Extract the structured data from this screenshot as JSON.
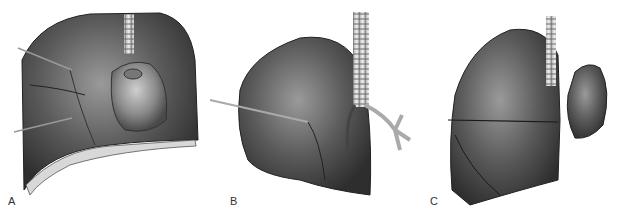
{
  "figure": {
    "panels": [
      {
        "label": "A",
        "description": "Opened thorax showing lungs and heart with probes"
      },
      {
        "label": "B",
        "description": "Right lung with trachea and bronchi, probe in hilum"
      },
      {
        "label": "C",
        "description": "Lung with lobes and trachea, detached portion"
      }
    ]
  }
}
